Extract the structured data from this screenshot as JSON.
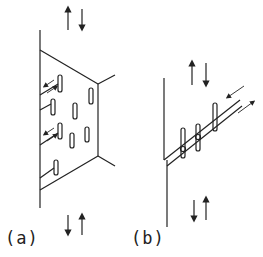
{
  "figure": {
    "panels": [
      {
        "id": "a",
        "label": "(a)"
      },
      {
        "id": "b",
        "label": "(b)"
      }
    ],
    "colors": {
      "stroke": "#222222",
      "background": "#ffffff"
    }
  }
}
